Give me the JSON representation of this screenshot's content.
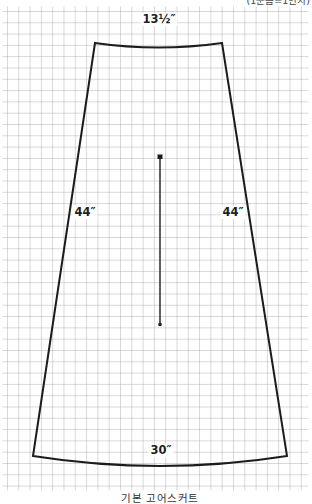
{
  "diagram": {
    "type": "sewing-pattern",
    "caption": "기본 고어스커트",
    "scale_note": "(1눈금=1인치)",
    "labels": {
      "waist": "13½″",
      "left_side": "44″",
      "right_side": "44″",
      "hem": "30″"
    },
    "grid": {
      "cell_size_px": 11.3,
      "unit": "1 grid square = 1 inch"
    },
    "colors": {
      "background": "#ffffff",
      "grid_line": "#9a9a9a",
      "pattern_outline": "#1c1c1c",
      "text": "#1f1f1f"
    }
  }
}
